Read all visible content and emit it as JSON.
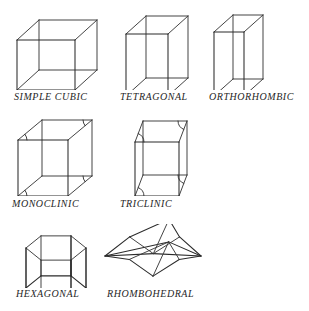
{
  "figure": {
    "background_color": "#ffffff",
    "line_color": "#2b2b2b",
    "label_color": "#262626",
    "width": 309,
    "height": 311
  },
  "cells": [
    {
      "id": "simple-cubic",
      "label": "SIMPLE CUBIC",
      "row": 1,
      "column": 1,
      "shape": "cube",
      "label_x": 14,
      "label_y": 91,
      "box": {
        "x": 12,
        "y": 12,
        "w": 96,
        "h": 78
      },
      "geometry": {
        "front": {
          "x": 5,
          "y": 28,
          "w": 58,
          "h": 50
        },
        "depth_dx": 22,
        "depth_dy": -20
      }
    },
    {
      "id": "tetragonal",
      "label": "TETRAGONAL",
      "row": 1,
      "column": 2,
      "shape": "box",
      "label_x": 120,
      "label_y": 91,
      "box": {
        "x": 118,
        "y": 12,
        "w": 90,
        "h": 78
      },
      "geometry": {
        "front": {
          "x": 8,
          "y": 22,
          "w": 42,
          "h": 62
        },
        "depth_dx": 20,
        "depth_dy": -18
      }
    },
    {
      "id": "orthorhombic",
      "label": "ORTHORHOMBIC",
      "row": 1,
      "column": 3,
      "shape": "box",
      "label_x": 209,
      "label_y": 91,
      "box": {
        "x": 206,
        "y": 12,
        "w": 96,
        "h": 78
      },
      "geometry": {
        "front": {
          "x": 8,
          "y": 20,
          "w": 30,
          "h": 64
        },
        "depth_dx": 19,
        "depth_dy": -17
      }
    },
    {
      "id": "monoclinic",
      "label": "MONOCLINIC",
      "row": 2,
      "column": 1,
      "shape": "box-angles",
      "label_x": 12,
      "label_y": 198,
      "box": {
        "x": 12,
        "y": 118,
        "w": 96,
        "h": 78
      },
      "geometry": {
        "front": {
          "x": 6,
          "y": 22,
          "w": 50,
          "h": 56
        },
        "depth_dx": 24,
        "depth_dy": -20
      }
    },
    {
      "id": "triclinic",
      "label": "TRICLINIC",
      "row": 2,
      "column": 2,
      "shape": "sheared-angles",
      "label_x": 120,
      "label_y": 198,
      "box": {
        "x": 113,
        "y": 118,
        "w": 100,
        "h": 78
      },
      "geometry": {
        "front": {
          "x": 4,
          "y": 24,
          "w": 44,
          "h": 54
        },
        "depth_dx": 26,
        "depth_dy": -21,
        "shear_dx": 18
      }
    },
    {
      "id": "hexagonal",
      "label": "HEXAGONAL",
      "row": 3,
      "column": 1,
      "shape": "hex-prism",
      "label_x": 16,
      "label_y": 288,
      "box": {
        "x": 12,
        "y": 224,
        "w": 96,
        "h": 64
      },
      "geometry": {
        "radius_x": 30,
        "radius_y": 14,
        "height": 40,
        "center_x": 44,
        "center_y": 24
      }
    },
    {
      "id": "rhombohedral",
      "label": "RHOMBOHEDRAL",
      "row": 3,
      "column": 2,
      "shape": "rhombohedron",
      "label_x": 107,
      "label_y": 288,
      "box": {
        "x": 100,
        "y": 224,
        "w": 106,
        "h": 64
      },
      "geometry": {
        "half_width": 48,
        "half_height": 27,
        "offset_x": 16,
        "offset_y": -11
      }
    }
  ]
}
